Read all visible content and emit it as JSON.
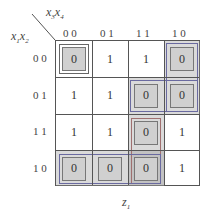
{
  "map": {
    "row_vars": "x1x2",
    "col_vars": "x3x4",
    "output": "z1",
    "col_labels": [
      "0 0",
      "0 1",
      "1 1",
      "1 0"
    ],
    "row_labels": [
      "0 0",
      "0 1",
      "1 1",
      "1 0"
    ],
    "cells": [
      [
        "0",
        "1",
        "1",
        "0"
      ],
      [
        "1",
        "1",
        "0",
        "0"
      ],
      [
        "1",
        "1",
        "0",
        "1"
      ],
      [
        "0",
        "0",
        "0",
        "1"
      ]
    ]
  },
  "labels": {
    "x1": "x",
    "x1_sub": "1",
    "x2": "x",
    "x2_sub": "2",
    "x3": "x",
    "x3_sub": "3",
    "x4": "x",
    "x4_sub": "4",
    "z": "z",
    "z_sub": "1"
  },
  "groups": [
    {
      "name": "corners",
      "cells": [
        [
          0,
          0
        ],
        [
          0,
          3
        ],
        [
          3,
          0
        ]
      ]
    },
    {
      "name": "row-10-cols-00-01-11",
      "cells": [
        [
          3,
          0
        ],
        [
          3,
          1
        ],
        [
          3,
          2
        ]
      ]
    },
    {
      "name": "col-11-rows-01-11-10",
      "cells": [
        [
          1,
          2
        ],
        [
          2,
          2
        ],
        [
          3,
          2
        ]
      ]
    },
    {
      "name": "row-01-cols-11-10",
      "cells": [
        [
          1,
          2
        ],
        [
          1,
          3
        ]
      ]
    },
    {
      "name": "col-10-rows-00-01",
      "cells": [
        [
          0,
          3
        ],
        [
          1,
          3
        ]
      ]
    }
  ]
}
